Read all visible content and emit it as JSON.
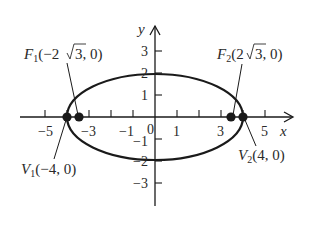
{
  "diagram": {
    "type": "ellipse-on-axes",
    "equation_implied": "x^2/16 + y^2/4 = 1",
    "axes": {
      "x_label": "x",
      "y_label": "y",
      "x_ticks": [
        "−5",
        "−3",
        "−1",
        "1",
        "3",
        "5"
      ],
      "x_origin_label": "0",
      "y_ticks": [
        "3",
        "2",
        "1",
        "−1",
        "−2",
        "−3"
      ]
    },
    "points": {
      "F1": {
        "name": "F",
        "sub": "1",
        "coords": "(−2√3, 0)",
        "pre": "(−2",
        "root": "3",
        "post": ", 0)"
      },
      "F2": {
        "name": "F",
        "sub": "2",
        "coords": "(2√3, 0)",
        "pre": "(2",
        "root": "3",
        "post": ", 0)"
      },
      "V1": {
        "name": "V",
        "sub": "1",
        "coords": "(−4, 0)"
      },
      "V2": {
        "name": "V",
        "sub": "2",
        "coords": "(4, 0)"
      }
    },
    "colors": {
      "ink": "#1a1a1a",
      "background": "#ffffff"
    }
  }
}
